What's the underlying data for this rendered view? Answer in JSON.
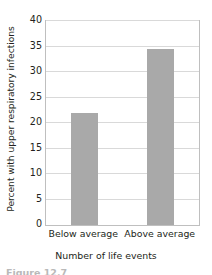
{
  "chart_data": {
    "type": "bar",
    "title": "",
    "categories": [
      "Below average",
      "Above average"
    ],
    "values": [
      22.0,
      34.5
    ],
    "xlabel": "Number of life events",
    "ylabel": "Percent with upper respiratory infections",
    "ylim": [
      0,
      40
    ],
    "ytick_labels": [
      "0",
      "5",
      "10",
      "15",
      "20",
      "25",
      "30",
      "35",
      "40"
    ],
    "ytick_values": [
      0,
      5,
      10,
      15,
      20,
      25,
      30,
      35,
      40
    ],
    "grid": true,
    "legend": null,
    "bar_color": "#a9a9a9",
    "grid_color": "#d9d9d9",
    "axis_color": "#bfbfbf",
    "text_color": "#231f20"
  },
  "caption": {
    "text": "Figure 12.7"
  }
}
